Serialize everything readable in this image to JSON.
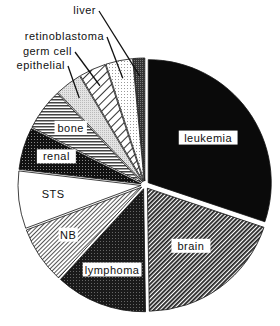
{
  "chart_data": {
    "type": "pie",
    "title": "",
    "start_angle_deg": 0,
    "direction": "clockwise",
    "exploded": true,
    "slices": [
      {
        "label": "leukemia",
        "value": 30.0,
        "fill": "solid-black"
      },
      {
        "label": "brain",
        "value": 19.5,
        "fill": "dense-diagonal-hatch"
      },
      {
        "label": "lymphoma",
        "value": 12.0,
        "fill": "dark-stipple"
      },
      {
        "label": "NB",
        "value": 7.5,
        "fill": "light-diagonal-hatch"
      },
      {
        "label": "STS",
        "value": 7.5,
        "fill": "white"
      },
      {
        "label": "renal",
        "value": 5.5,
        "fill": "dark-dots"
      },
      {
        "label": "bone",
        "value": 5.5,
        "fill": "horizontal-lines"
      },
      {
        "label": "epithelial",
        "value": 3.5,
        "fill": "light-gray"
      },
      {
        "label": "germ cell",
        "value": 3.5,
        "fill": "wide-diagonal-hatch"
      },
      {
        "label": "retinoblastoma",
        "value": 3.5,
        "fill": "fine-dots"
      },
      {
        "label": "liver",
        "value": 1.5,
        "fill": "dark-gray"
      }
    ],
    "legend": "none",
    "labels": {
      "inside": [
        "leukemia",
        "brain",
        "lymphoma",
        "NB",
        "STS",
        "renal",
        "bone"
      ],
      "outside_with_leaders": [
        "liver",
        "retinoblastoma",
        "germ cell",
        "epithelial"
      ]
    }
  }
}
